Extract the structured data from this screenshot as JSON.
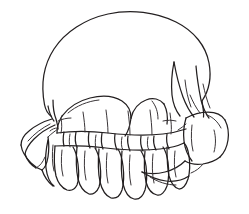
{
  "image": {
    "title": "Skull line drawing",
    "subject": "human skull seen from below-front, cranial dome with dental arch",
    "style": "black ink line art on white background",
    "width": 249,
    "height": 214
  },
  "colors": {
    "background": "#ffffff",
    "ink": "#231f20",
    "ink_light": "#3a3538"
  },
  "parts": [
    {
      "name": "cranial-dome",
      "label": "Cranial dome"
    },
    {
      "name": "dental-arch",
      "label": "Dental arch"
    },
    {
      "name": "left-zygomatic-arch",
      "label": "Left zygomatic arch"
    },
    {
      "name": "right-zygomatic-arch",
      "label": "Right zygomatic arch"
    },
    {
      "name": "upper-teeth-row",
      "label": "Upper teeth row"
    },
    {
      "name": "lower-teeth-row",
      "label": "Lower teeth row"
    },
    {
      "name": "right-process-spikes",
      "label": "Right process spikes"
    }
  ],
  "caption": ""
}
